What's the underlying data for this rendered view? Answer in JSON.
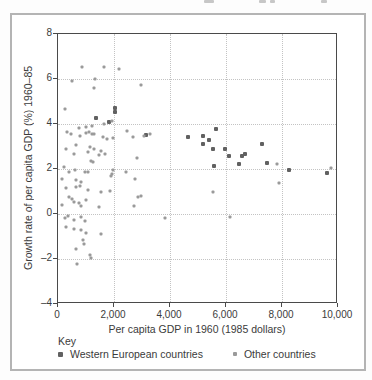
{
  "figure": {
    "key_title": "Key",
    "card_border_color": "#b4b4b4"
  },
  "chart_data": {
    "type": "scatter",
    "title": "",
    "xlabel": "Per capita GDP in 1960 (1985 dollars)",
    "ylabel": "Growth rate of per capita GDP (%) 1960–85",
    "xlim": [
      0,
      10000
    ],
    "ylim": [
      -4,
      8
    ],
    "grid": "dotted, at every labeled tick",
    "legend_position": "bottom",
    "x_ticks": [
      {
        "value": 0,
        "label": "0"
      },
      {
        "value": 2000,
        "label": "2,000"
      },
      {
        "value": 4000,
        "label": "4,000"
      },
      {
        "value": 6000,
        "label": "6,000"
      },
      {
        "value": 8000,
        "label": "8,000"
      },
      {
        "value": 10000,
        "label": "10,000"
      }
    ],
    "y_ticks": [
      {
        "value": 8,
        "label": "8"
      },
      {
        "value": 6,
        "label": "6"
      },
      {
        "value": 4,
        "label": "4"
      },
      {
        "value": 2,
        "label": "2"
      },
      {
        "value": 0,
        "label": "0"
      },
      {
        "value": -2,
        "label": "–2"
      },
      {
        "value": -4,
        "label": "–4"
      }
    ],
    "series": [
      {
        "name": "Western European countries",
        "marker": "square",
        "color": "#616161",
        "size": 4,
        "points": [
          [
            2040,
            4.72
          ],
          [
            2030,
            4.52
          ],
          [
            1820,
            4.1
          ],
          [
            1360,
            4.25
          ],
          [
            3150,
            3.5
          ],
          [
            5650,
            3.8
          ],
          [
            4630,
            3.42
          ],
          [
            5170,
            3.47
          ],
          [
            5380,
            3.3
          ],
          [
            5170,
            3.12
          ],
          [
            5520,
            2.9
          ],
          [
            5980,
            2.87
          ],
          [
            6100,
            2.58
          ],
          [
            6570,
            2.6
          ],
          [
            6690,
            2.66
          ],
          [
            6450,
            2.21
          ],
          [
            5570,
            2.15
          ],
          [
            7300,
            3.1
          ],
          [
            7460,
            2.28
          ],
          [
            8250,
            1.94
          ],
          [
            9620,
            1.84
          ]
        ]
      },
      {
        "name": "Other countries",
        "marker": "square",
        "color": "#9a9a9a",
        "size": 3,
        "points": [
          [
            860,
            6.52
          ],
          [
            1655,
            6.55
          ],
          [
            2190,
            6.45
          ],
          [
            500,
            5.9
          ],
          [
            1330,
            6.0
          ],
          [
            1300,
            5.6
          ],
          [
            2960,
            5.75
          ],
          [
            260,
            4.68
          ],
          [
            1655,
            4.0
          ],
          [
            1920,
            4.13
          ],
          [
            1205,
            3.91
          ],
          [
            760,
            3.84
          ],
          [
            1000,
            3.88
          ],
          [
            310,
            3.66
          ],
          [
            465,
            3.56
          ],
          [
            800,
            3.48
          ],
          [
            1000,
            3.6
          ],
          [
            1120,
            3.63
          ],
          [
            1205,
            3.57
          ],
          [
            1300,
            3.54
          ],
          [
            1600,
            3.41
          ],
          [
            1740,
            3.33
          ],
          [
            1950,
            3.39
          ],
          [
            2460,
            3.7
          ],
          [
            2690,
            3.44
          ],
          [
            3070,
            3.48
          ],
          [
            3270,
            3.55
          ],
          [
            285,
            2.89
          ],
          [
            645,
            3.09
          ],
          [
            1154,
            2.98
          ],
          [
            1296,
            2.87
          ],
          [
            1536,
            2.8
          ],
          [
            2830,
            2.48
          ],
          [
            580,
            2.67
          ],
          [
            1060,
            2.74
          ],
          [
            1475,
            2.62
          ],
          [
            1690,
            2.67
          ],
          [
            1180,
            2.37
          ],
          [
            1240,
            2.3
          ],
          [
            225,
            2.07
          ],
          [
            620,
            1.97
          ],
          [
            405,
            1.85
          ],
          [
            975,
            1.88
          ],
          [
            1082,
            1.88
          ],
          [
            2420,
            1.88
          ],
          [
            1965,
            1.94
          ],
          [
            1918,
            1.79
          ],
          [
            1880,
            1.67
          ],
          [
            2750,
            1.56
          ],
          [
            145,
            1.58
          ],
          [
            645,
            1.52
          ],
          [
            820,
            1.41
          ],
          [
            285,
            1.17
          ],
          [
            645,
            1.21
          ],
          [
            785,
            1.26
          ],
          [
            1060,
            1.07
          ],
          [
            1535,
            0.99
          ],
          [
            1845,
            1.03
          ],
          [
            5520,
            1.0
          ],
          [
            405,
            0.77
          ],
          [
            500,
            0.67
          ],
          [
            580,
            0.55
          ],
          [
            745,
            0.48
          ],
          [
            1000,
            0.62
          ],
          [
            145,
            0.4
          ],
          [
            820,
            0.37
          ],
          [
            1475,
            0.32
          ],
          [
            2870,
            0.74
          ],
          [
            2950,
            0.81
          ],
          [
            2715,
            0.34
          ],
          [
            345,
            -0.08
          ],
          [
            260,
            -0.19
          ],
          [
            580,
            -0.27
          ],
          [
            820,
            -0.12
          ],
          [
            975,
            -0.31
          ],
          [
            3832,
            -0.16
          ],
          [
            6140,
            -0.12
          ],
          [
            296,
            -0.56
          ],
          [
            561,
            -0.65
          ],
          [
            821,
            -0.71
          ],
          [
            1000,
            -0.83
          ],
          [
            1536,
            -0.9
          ],
          [
            882,
            -1.16
          ],
          [
            939,
            -1.35
          ],
          [
            643,
            -1.57
          ],
          [
            1154,
            -1.84
          ],
          [
            1179,
            -1.94
          ],
          [
            679,
            -2.24
          ],
          [
            9760,
            2.06
          ],
          [
            7880,
            1.39
          ],
          [
            7830,
            2.21
          ]
        ]
      }
    ]
  }
}
